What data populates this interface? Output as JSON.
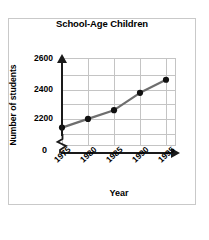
{
  "frame": {
    "border_color": "#c9c9c9",
    "background": "#ffffff"
  },
  "chart_data": {
    "type": "line",
    "title": "School-Age Children",
    "xlabel": "Year",
    "ylabel": "Number of students",
    "categories": [
      "1975",
      "1980",
      "1985",
      "1990",
      "1995"
    ],
    "values": [
      2250,
      2300,
      2350,
      2450,
      2525
    ],
    "series": [
      {
        "name": "Number of students",
        "values": [
          2250,
          2300,
          2350,
          2450,
          2525
        ]
      }
    ],
    "ytick_labels": [
      "2600",
      "2400",
      "2200"
    ],
    "ytick_values": [
      2600,
      2400,
      2200
    ],
    "zero_label": "0",
    "ylim": [
      2150,
      2650
    ],
    "axis_break": true,
    "grid": true,
    "grid_color": "#c4c4c4",
    "legend": false,
    "line_color": "#6e6e6e",
    "marker_color": "#111111",
    "axis_color": "#1a1a1a"
  }
}
